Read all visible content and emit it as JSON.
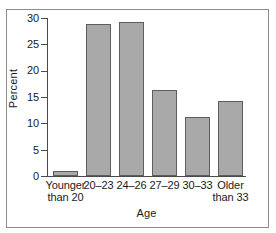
{
  "chart_data": {
    "type": "bar",
    "title": "",
    "xlabel": "Age",
    "ylabel": "Percent",
    "categories": [
      "Younger than 20",
      "20–23",
      "24–26",
      "27–29",
      "30–33",
      "Older than 33"
    ],
    "category_lines": [
      {
        "line1": "Younger",
        "line2": "than 20"
      },
      {
        "line1": "20–23",
        "line2": ""
      },
      {
        "line1": "24–26",
        "line2": ""
      },
      {
        "line1": "27–29",
        "line2": ""
      },
      {
        "line1": "30–33",
        "line2": ""
      },
      {
        "line1": "Older",
        "line2": "than 33"
      }
    ],
    "values": [
      1.0,
      28.8,
      29.3,
      16.3,
      11.2,
      14.2
    ],
    "ylim": [
      0,
      30
    ],
    "yticks": [
      0,
      5,
      10,
      15,
      20,
      25,
      30
    ],
    "ytick_labels": [
      "0",
      "5",
      "10",
      "15",
      "20",
      "25",
      "30"
    ],
    "grid": false,
    "legend": "none",
    "bar_fill_color": "#a9a9a9",
    "bar_edge_color": "#5d5d5d",
    "axis_color": "#4a4a4a",
    "frame_color": "#8d8d8d",
    "background_color": "#ffffff"
  }
}
